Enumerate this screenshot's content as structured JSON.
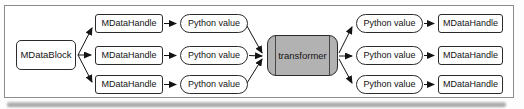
{
  "diagram": {
    "nodes": {
      "data_block": "MDataBlock",
      "input_handles": [
        "MDataHandle",
        "MDataHandle",
        "MDataHandle"
      ],
      "input_values": [
        "Python value",
        "Python value",
        "Python value"
      ],
      "transformer": "transformer",
      "output_values": [
        "Python value",
        "Python value",
        "Python value"
      ],
      "output_handles": [
        "MDataHandle",
        "MDataHandle",
        "MDataHandle"
      ]
    },
    "colors": {
      "background": "#ffffff",
      "frame_border": "#8c8c8c",
      "node_border": "#2b2b2b",
      "transformer_fill": "#b2b2b2",
      "arrow": "#141414"
    }
  }
}
